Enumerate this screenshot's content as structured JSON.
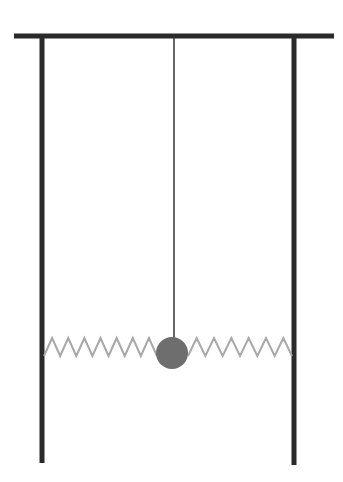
{
  "diagram": {
    "colors": {
      "background": "#ffffff",
      "frame": "#2a2a2a",
      "string": "#333333",
      "spring": "#a8a8a8",
      "bob": "#6e6e6e"
    },
    "beam": {
      "x1": 14,
      "y1": 36,
      "x2": 334,
      "y2": 36,
      "width": 5
    },
    "left_post": {
      "x": 42,
      "y1": 36,
      "y2": 463,
      "width": 5
    },
    "right_post": {
      "x": 294,
      "y1": 36,
      "y2": 465,
      "width": 5
    },
    "string": {
      "x": 174,
      "y1": 36,
      "y2": 340,
      "width": 1.5
    },
    "bob": {
      "cx": 172,
      "cy": 353,
      "r": 16
    },
    "left_spring": {
      "x_start": 44,
      "x_end": 157,
      "y_low": 356,
      "y_high": 338,
      "peaks": 7
    },
    "right_spring": {
      "x_start": 188,
      "x_end": 292,
      "y_low": 356,
      "y_high": 338,
      "peaks": 6
    }
  }
}
